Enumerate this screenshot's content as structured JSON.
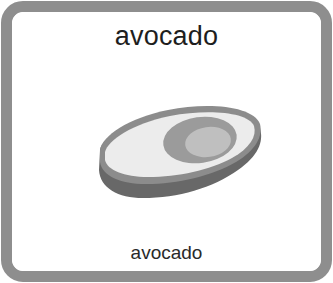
{
  "card": {
    "title": "avocado",
    "caption": "avocado",
    "image": {
      "icon": "avocado-icon",
      "description": "avocado half illustration (grayscale)"
    },
    "colors": {
      "frame": "#8e8e8e",
      "background": "#ffffff",
      "text": "#1e1e1e",
      "skin_dark": "#6a6a6a",
      "skin_mid": "#8a8a8a",
      "flesh": "#ececec",
      "pit_outer": "#9a9a9a",
      "pit_inner": "#bdbdbd"
    }
  }
}
